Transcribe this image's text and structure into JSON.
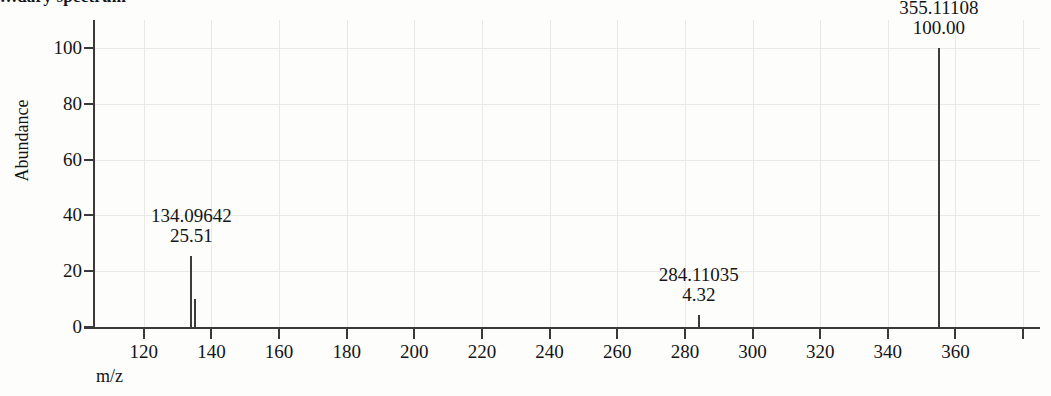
{
  "title": "…dary spectrum",
  "axes": {
    "y_title": "Abundance",
    "x_title": "m/z"
  },
  "chart_data": {
    "type": "bar",
    "title": "…dary spectrum",
    "xlabel": "m/z",
    "ylabel": "Abundance",
    "xlim": [
      105,
      385
    ],
    "ylim": [
      0,
      110
    ],
    "grid": true,
    "legend": "none",
    "xticks": [
      120,
      140,
      160,
      180,
      200,
      220,
      240,
      260,
      280,
      300,
      320,
      340,
      360,
      380
    ],
    "xtick_labels": [
      "120",
      "140",
      "160",
      "180",
      "200",
      "220",
      "240",
      "260",
      "280",
      "300",
      "320",
      "340",
      "360",
      ""
    ],
    "yticks": [
      0,
      20,
      40,
      60,
      80,
      100
    ],
    "ytick_labels": [
      "0",
      "20",
      "40",
      "60",
      "80",
      "100"
    ],
    "x": [
      134.09642,
      135.1,
      284.11035,
      355.11108
    ],
    "values": [
      25.51,
      10.2,
      4.32,
      100.0
    ],
    "labeled_peaks": [
      {
        "mz": "134.09642",
        "abundance": "25.51",
        "mz_value": 134.09642,
        "abundance_value": 25.51
      },
      {
        "mz": "284.11035",
        "abundance": "4.32",
        "mz_value": 284.11035,
        "abundance_value": 4.32
      },
      {
        "mz": "355.11108",
        "abundance": "100.00",
        "mz_value": 355.11108,
        "abundance_value": 100.0
      }
    ]
  },
  "colors": {
    "peak": "#3c3c3c",
    "axis": "#3a3a3a",
    "grid": "#e9e9e6",
    "text": "#141414",
    "background": "#fdfdfc"
  }
}
